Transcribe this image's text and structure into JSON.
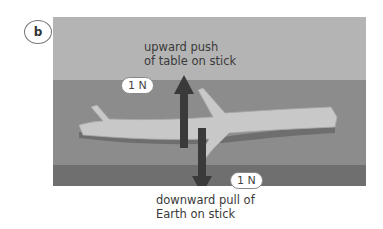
{
  "panel": {
    "label": "b"
  },
  "forces": {
    "upward": {
      "label": "upward push\nof table on stick",
      "line1": "upward push",
      "line2": "of table on stick",
      "magnitude": "1 N"
    },
    "downward": {
      "label": "downward pull of\nEarth on stick",
      "line1": "downward pull of",
      "line2": "Earth on stick",
      "magnitude": "1 N"
    }
  },
  "colors": {
    "background_top": "#b4b4b4",
    "table_surface": "#8c8c8c",
    "table_edge": "#6f6f6f",
    "stick": "#c8c8c8",
    "arrow": "#3a3a3a"
  }
}
